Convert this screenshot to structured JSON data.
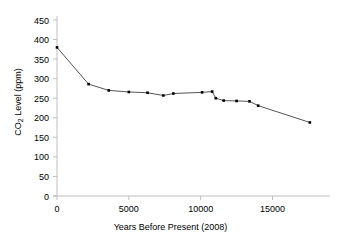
{
  "chart_data": {
    "type": "line",
    "title": "",
    "xlabel": "Years Before Present (2008)",
    "ylabel_prefix": "CO",
    "ylabel_sub": "2",
    "ylabel_suffix": " Level (ppm)",
    "ylabel": "CO2 Level (ppm)",
    "xlim": [
      0,
      19000
    ],
    "ylim": [
      0,
      450
    ],
    "xticks": [
      0,
      5000,
      10000,
      15000
    ],
    "xtick_labels": [
      "0",
      "5000",
      "10000",
      "15000"
    ],
    "yticks": [
      0,
      50,
      100,
      150,
      200,
      250,
      300,
      350,
      400,
      450
    ],
    "ytick_labels": [
      "0",
      "50",
      "100",
      "150",
      "200",
      "250",
      "300",
      "350",
      "400",
      "450"
    ],
    "grid": false,
    "legend": "none",
    "marker": "square",
    "marker_color": "#000000",
    "line_color": "#555555",
    "axis_color": "#bfbfbf",
    "text_color": "#000000",
    "x": [
      0,
      2200,
      3600,
      5000,
      6300,
      7400,
      8100,
      10100,
      10800,
      11050,
      11600,
      12500,
      13400,
      14000,
      17600
    ],
    "y": [
      380,
      286,
      270,
      266,
      264,
      257,
      262,
      265,
      267,
      250,
      244,
      243,
      242,
      231,
      188
    ],
    "points": [
      {
        "x": 0,
        "y": 380
      },
      {
        "x": 2200,
        "y": 286
      },
      {
        "x": 3600,
        "y": 270
      },
      {
        "x": 5000,
        "y": 266
      },
      {
        "x": 6300,
        "y": 264
      },
      {
        "x": 7400,
        "y": 257
      },
      {
        "x": 8100,
        "y": 262
      },
      {
        "x": 10100,
        "y": 265
      },
      {
        "x": 10800,
        "y": 267
      },
      {
        "x": 11050,
        "y": 250
      },
      {
        "x": 11600,
        "y": 244
      },
      {
        "x": 12500,
        "y": 243
      },
      {
        "x": 13400,
        "y": 242
      },
      {
        "x": 14000,
        "y": 231
      },
      {
        "x": 17600,
        "y": 188
      }
    ]
  }
}
